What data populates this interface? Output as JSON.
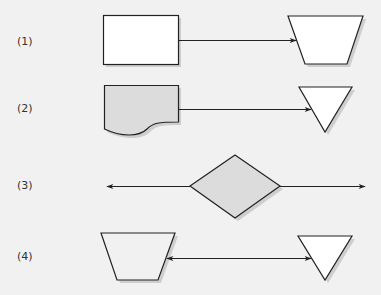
{
  "colors": {
    "background": "#f1f1f1",
    "stroke": "#222222",
    "fill_white": "#ffffff",
    "fill_gray": "#dcdcdc",
    "shadow": "#b8b8b8"
  },
  "rows": [
    {
      "label": "(1)",
      "left_shape": "rectangle",
      "right_shape": "inverted-trapezoid",
      "connector": "arrow-right"
    },
    {
      "label": "(2)",
      "left_shape": "document",
      "right_shape": "inverted-triangle",
      "connector": "arrow-right"
    },
    {
      "label": "(3)",
      "center_shape": "diamond",
      "connector": "double-arrow-out"
    },
    {
      "label": "(4)",
      "left_shape": "inverted-trapezoid",
      "right_shape": "inverted-triangle",
      "connector": "double-arrow"
    }
  ]
}
